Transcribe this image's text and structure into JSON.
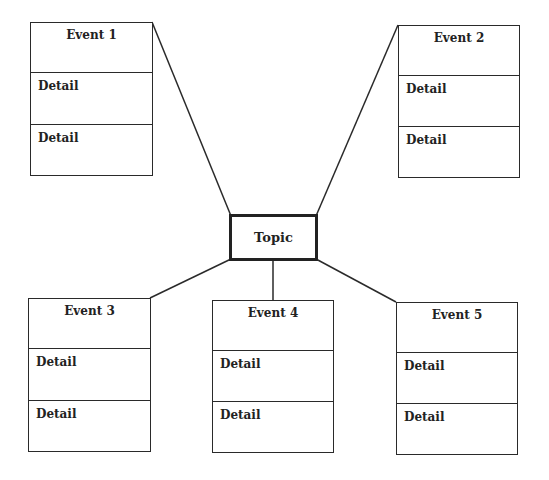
{
  "diagram": {
    "type": "event map / graphic organizer",
    "topic": {
      "label": "Topic"
    },
    "events": [
      {
        "id": "event-1",
        "title": "Event 1",
        "details": [
          "Detail",
          "Detail"
        ]
      },
      {
        "id": "event-2",
        "title": "Event 2",
        "details": [
          "Detail",
          "Detail"
        ]
      },
      {
        "id": "event-3",
        "title": "Event 3",
        "details": [
          "Detail",
          "Detail"
        ]
      },
      {
        "id": "event-4",
        "title": "Event 4",
        "details": [
          "Detail",
          "Detail"
        ]
      },
      {
        "id": "event-5",
        "title": "Event 5",
        "details": [
          "Detail",
          "Detail"
        ]
      }
    ],
    "connections": [
      {
        "from": "topic",
        "to": "event-1"
      },
      {
        "from": "topic",
        "to": "event-2"
      },
      {
        "from": "topic",
        "to": "event-3"
      },
      {
        "from": "topic",
        "to": "event-4"
      },
      {
        "from": "topic",
        "to": "event-5"
      }
    ],
    "colors": {
      "line": "#2a2a2a",
      "background": "#ffffff",
      "text": "#222222"
    }
  }
}
